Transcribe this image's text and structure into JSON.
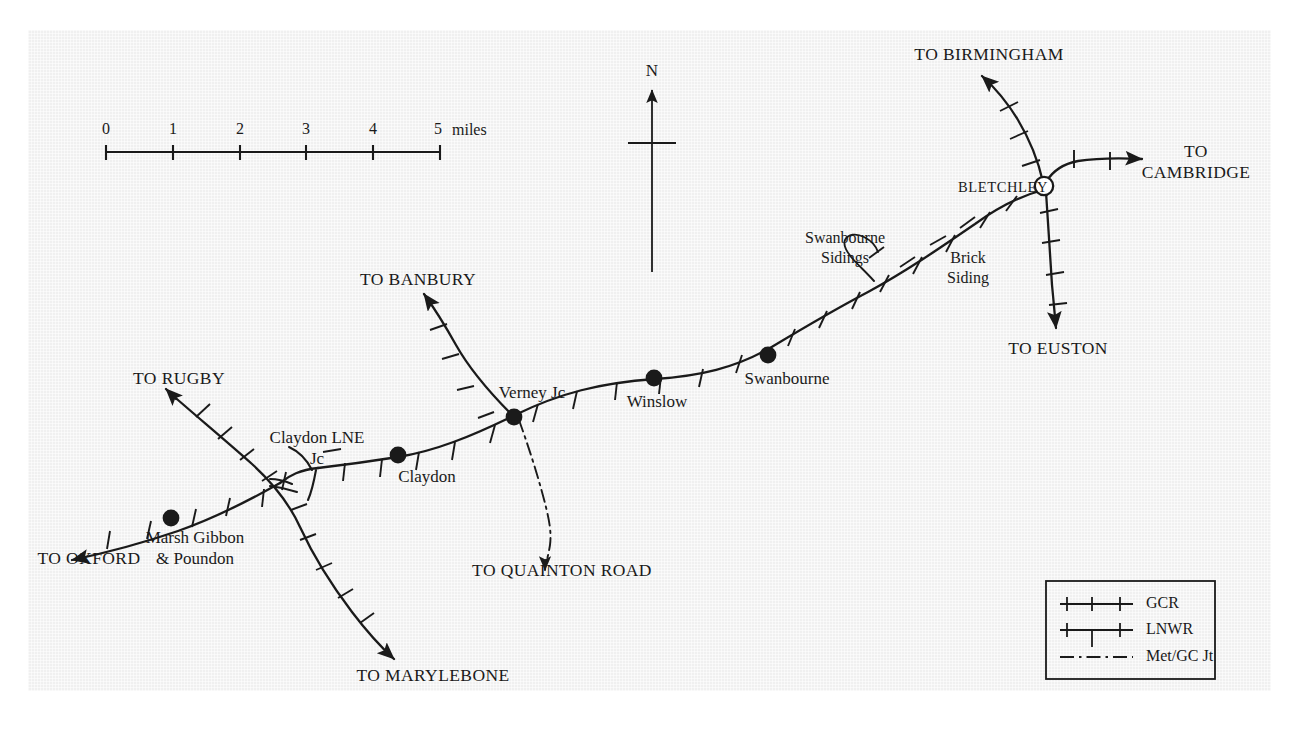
{
  "map": {
    "title": "Railway network map around Verney Junction and Bletchley",
    "background_color": "#f0f0f0",
    "line_color": "#1a1a1a",
    "north_label": "N",
    "scale": {
      "unit_label": "miles",
      "ticks": [
        "0",
        "1",
        "2",
        "3",
        "4",
        "5"
      ]
    }
  },
  "stations": [
    {
      "name": "Marsh Gibbon\n& Poundon",
      "line1": "Marsh Gibbon",
      "line2": "& Poundon",
      "marker": "filled-circle"
    },
    {
      "name": "Claydon",
      "line1": "Claydon",
      "marker": "filled-circle"
    },
    {
      "name": "Verney Jc",
      "line1": "Verney Jc",
      "marker": "filled-circle"
    },
    {
      "name": "Winslow",
      "line1": "Winslow",
      "marker": "filled-circle"
    },
    {
      "name": "Swanbourne",
      "line1": "Swanbourne",
      "marker": "filled-circle"
    },
    {
      "name": "BLETCHLEY",
      "line1": "BLETCHLEY",
      "marker": "open-circle"
    }
  ],
  "junction_labels": {
    "claydon_lne_jc_line1": "Claydon LNE",
    "claydon_lne_jc_line2": "Jc"
  },
  "sidings": [
    {
      "line1": "Swanbourne",
      "line2": "Sidings"
    },
    {
      "line1": "Brick",
      "line2": "Siding"
    }
  ],
  "destinations": [
    {
      "label": "TO BIRMINGHAM"
    },
    {
      "label": "TO\nCAMBRIDGE",
      "line1": "TO",
      "line2": "CAMBRIDGE"
    },
    {
      "label": "TO EUSTON"
    },
    {
      "label": "TO BANBURY"
    },
    {
      "label": "TO RUGBY"
    },
    {
      "label": "TO OXFORD"
    },
    {
      "label": "TO MARYLEBONE"
    },
    {
      "label": "TO QUAINTON ROAD"
    }
  ],
  "legend": {
    "items": [
      {
        "key": "gcr",
        "label": "GCR",
        "style": "ticks-above"
      },
      {
        "key": "lnwr",
        "label": "LNWR",
        "style": "ticks-above-and-below"
      },
      {
        "key": "met_gc_jt",
        "label": "Met/GC Jt",
        "style": "dash-dot"
      }
    ]
  }
}
